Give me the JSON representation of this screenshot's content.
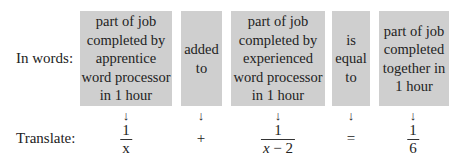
{
  "labels": {
    "words": "In words:",
    "translate": "Translate:"
  },
  "boxes": [
    {
      "text": "part of job completed by apprentice word processor in 1 hour",
      "lines": [
        "part of job",
        "completed by",
        "apprentice",
        "word processor",
        "in 1 hour"
      ]
    },
    {
      "lines": [
        "added",
        "to"
      ]
    },
    {
      "lines": [
        "part of job",
        "completed by",
        "experienced",
        "word processor",
        "in 1 hour"
      ]
    },
    {
      "lines": [
        "is",
        "equal",
        "to"
      ]
    },
    {
      "lines": [
        "part of job",
        "completed",
        "together in",
        "1 hour"
      ]
    }
  ],
  "arrow": "↓",
  "translation": {
    "term1": {
      "num": "1",
      "den": "x"
    },
    "op1": "+",
    "term2": {
      "num": "1",
      "den_var": "x",
      "den_rest": " − 2"
    },
    "op2": "=",
    "term3": {
      "num": "1",
      "den": "6"
    }
  },
  "colors": {
    "box": "#cfcfcf"
  }
}
